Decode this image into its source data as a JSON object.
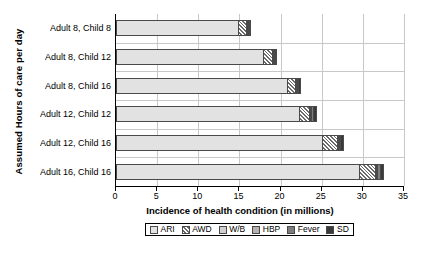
{
  "chart_data": {
    "type": "bar",
    "orientation": "horizontal",
    "stacked": true,
    "title": "",
    "xlabel": "Incidence of health condition (in millions)",
    "ylabel": "Assumed Hours of care per day",
    "xlim": [
      0,
      35
    ],
    "xticks": [
      0,
      5,
      10,
      15,
      20,
      25,
      30,
      35
    ],
    "grid": true,
    "grid_axis": "x",
    "legend_position": "bottom",
    "categories": [
      "Adult 8, Child 8",
      "Adult 8, Child 12",
      "Adult 8, Child 16",
      "Adult 12, Child 12",
      "Adult 12, Child 16",
      "Adult 16, Child 16"
    ],
    "series": [
      {
        "name": "ARI",
        "values": [
          14.8,
          17.9,
          20.8,
          22.2,
          25.0,
          29.5
        ]
      },
      {
        "name": "AWD",
        "values": [
          1.0,
          1.0,
          0.9,
          1.3,
          1.8,
          2.0
        ]
      },
      {
        "name": "W/B",
        "values": [
          0.05,
          0.05,
          0.05,
          0.05,
          0.05,
          0.05
        ]
      },
      {
        "name": "HBP",
        "values": [
          0.05,
          0.05,
          0.05,
          0.05,
          0.05,
          0.05
        ]
      },
      {
        "name": "Fever",
        "values": [
          0.1,
          0.15,
          0.15,
          0.2,
          0.2,
          0.3
        ]
      },
      {
        "name": "SD",
        "values": [
          0.3,
          0.25,
          0.45,
          0.5,
          0.45,
          0.55
        ]
      }
    ],
    "totals": [
      16.3,
      19.4,
      22.4,
      24.3,
      27.5,
      32.4
    ]
  },
  "axis": {
    "y_title": "Assumed Hours of care per day",
    "x_title": "Incidence of health condition (in millions)",
    "x_tick_labels": [
      "0",
      "5",
      "10",
      "15",
      "20",
      "25",
      "30",
      "35"
    ],
    "y_tick_labels": [
      "Adult 8, Child 8",
      "Adult 8, Child 12",
      "Adult 8, Child 16",
      "Adult 12, Child 12",
      "Adult 12, Child 16",
      "Adult 16, Child 16"
    ]
  },
  "legend": {
    "items": [
      {
        "label": "ARI",
        "swatch": "ari-swatch",
        "color": "#e2e2e2",
        "pattern": "solid-light"
      },
      {
        "label": "AWD",
        "swatch": "awd-swatch",
        "color": "#6b6b6b",
        "pattern": "diagonal-hatch"
      },
      {
        "label": "W/B",
        "swatch": "wb-swatch",
        "color": "#cfcfcf",
        "pattern": "solid"
      },
      {
        "label": "HBP",
        "swatch": "hbp-swatch",
        "color": "#b3b3b3",
        "pattern": "solid"
      },
      {
        "label": "Fever",
        "swatch": "fever-swatch",
        "color": "#7d7d7d",
        "pattern": "solid"
      },
      {
        "label": "SD",
        "swatch": "sd-swatch",
        "color": "#3a3a3a",
        "pattern": "solid"
      }
    ]
  }
}
